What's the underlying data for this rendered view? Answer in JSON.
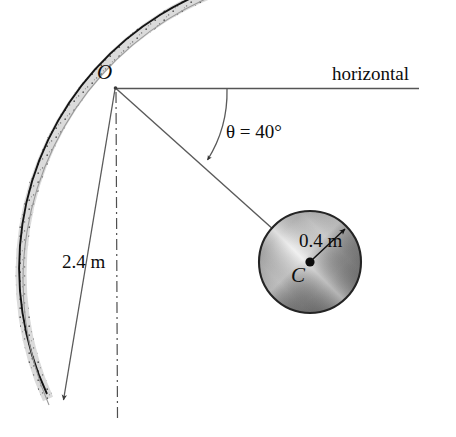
{
  "figure": {
    "labels": {
      "horizontal": "horizontal",
      "angle": "θ = 40°",
      "ball_radius": "0.4 m",
      "arm_length": "2.4 m",
      "pivot_point": "O",
      "ball_center": "C"
    },
    "values": {
      "angle_symbol": "θ",
      "angle_degrees": 40,
      "angle_unit": "°",
      "ball_radius_value": 0.4,
      "ball_radius_unit": "m",
      "arm_length_value": 2.4,
      "arm_length_unit": "m"
    },
    "geometry": {
      "pivot": {
        "x": 115,
        "y": 87
      },
      "ball_center": {
        "x": 310,
        "y": 262
      },
      "ball_pixel_radius": 51,
      "track_center": {
        "x": 115,
        "y": 87
      },
      "track_inner_radius": 303,
      "track_thickness": 11,
      "horizontal_line_end_x": 419,
      "arm_line_end": {
        "x": 283,
        "y": 238
      },
      "arrow_tip": {
        "x": 62,
        "y": 402
      },
      "dashdot_bottom_y": 418,
      "arc_start": {
        "x": 227,
        "y": 89
      },
      "arc_end": {
        "x": 206,
        "y": 161
      },
      "radius_arrow_tip": {
        "x": 346,
        "y": 228
      }
    },
    "colors": {
      "background": "#ffffff",
      "line": "#4a4a4a",
      "track_outline": "#1a1a1a",
      "track_fill": "#e8e8e8",
      "ball_outline": "#2b2b2b",
      "ball_light": "#d7d7d7",
      "ball_dark": "#6e6e6e",
      "text": "#0d0d0d"
    },
    "icon_names": {
      "pivot_marker": "pivot-point-icon",
      "center_dot": "center-dot-icon",
      "length_arrow": "length-arrow-icon",
      "angle_arc_arrow": "angle-arc-arrow-icon",
      "radius_arrow": "radius-arrow-icon",
      "centerline": "dash-dot-centerline-icon"
    }
  }
}
